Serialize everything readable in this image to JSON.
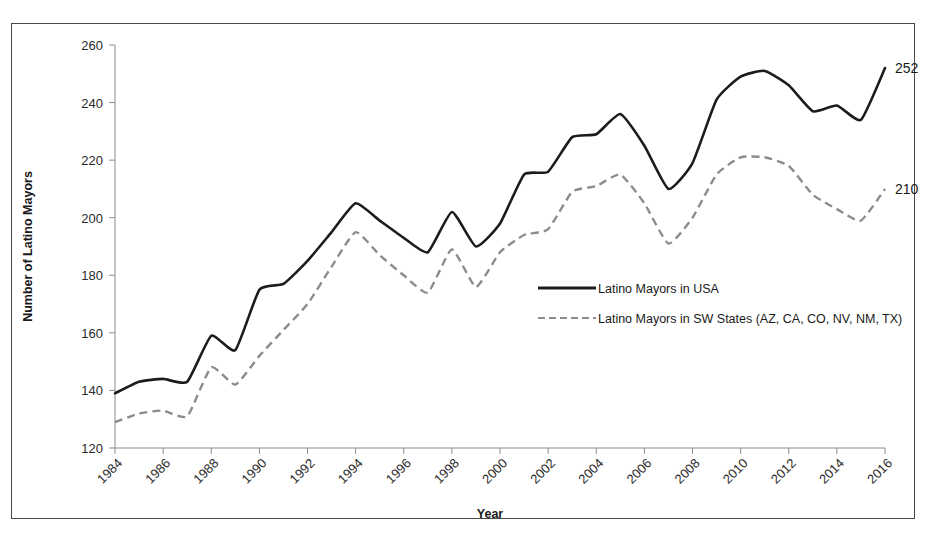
{
  "chart_data": {
    "type": "line",
    "title": "",
    "xlabel": "Year",
    "ylabel": "Number of Latino Mayors",
    "xlim": [
      1984,
      2016
    ],
    "ylim": [
      120,
      260
    ],
    "ytick_step": 20,
    "xtick_step": 2,
    "grid": false,
    "legend_position": "center-right",
    "xticks": [
      "1984",
      "1986",
      "1988",
      "1990",
      "1992",
      "1994",
      "1996",
      "1998",
      "2000",
      "2002",
      "2004",
      "2006",
      "2008",
      "2010",
      "2012",
      "2014",
      "2016"
    ],
    "yticks": [
      "120",
      "140",
      "160",
      "180",
      "200",
      "220",
      "240",
      "260"
    ],
    "x": [
      1984,
      1985,
      1986,
      1987,
      1988,
      1989,
      1990,
      1991,
      1992,
      1993,
      1994,
      1995,
      1996,
      1997,
      1998,
      1999,
      2000,
      2001,
      2002,
      2003,
      2004,
      2005,
      2006,
      2007,
      2008,
      2009,
      2010,
      2011,
      2012,
      2013,
      2014,
      2015,
      2016
    ],
    "series": [
      {
        "name": "Latino Mayors in USA",
        "style": "solid",
        "color": "#1c1c1c",
        "end_label": "252",
        "values": [
          139,
          143,
          144,
          143,
          159,
          154,
          175,
          177,
          185,
          195,
          205,
          199,
          193,
          188,
          202,
          190,
          198,
          215,
          216,
          228,
          229,
          236,
          225,
          210,
          219,
          241,
          249,
          251,
          246,
          237,
          239,
          234,
          252
        ]
      },
      {
        "name": "Latino Mayors in SW States (AZ, CA, CO, NV, NM, TX)",
        "style": "dashed",
        "color": "#8c8c8c",
        "end_label": "210",
        "values": [
          129,
          132,
          133,
          131,
          148,
          142,
          152,
          161,
          170,
          183,
          195,
          187,
          180,
          174,
          189,
          176,
          188,
          194,
          196,
          209,
          211,
          215,
          205,
          191,
          200,
          215,
          221,
          221,
          218,
          208,
          203,
          199,
          210
        ]
      }
    ]
  },
  "legend": {
    "items": [
      {
        "label": "Latino Mayors in USA",
        "style": "solid"
      },
      {
        "label": "Latino Mayors in SW States (AZ, CA, CO, NV, NM, TX)",
        "style": "dashed"
      }
    ]
  },
  "end_labels": {
    "usa": "252",
    "sw": "210"
  }
}
